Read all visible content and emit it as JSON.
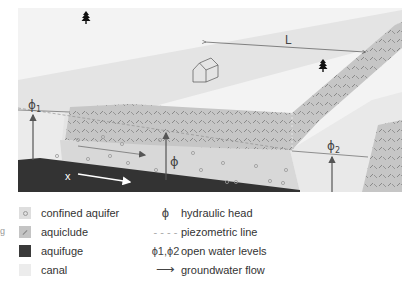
{
  "diagram": {
    "labels": {
      "length": "L",
      "phi1": "ϕ",
      "phi1_sub": "1",
      "phi2": "ϕ",
      "phi2_sub": "2",
      "phi": "ϕ",
      "x": "x"
    },
    "icons": [
      "tree-icon",
      "tree-icon",
      "house-icon"
    ],
    "colors": {
      "sky_ground": "#f2f2f2",
      "canal": "#e6e6e6",
      "aquiclude": "#c6c6c6",
      "aquifer": "#dadada",
      "aquifuge": "#333333",
      "arrow": "#555555"
    }
  },
  "legend": {
    "left": [
      {
        "label": "confined aquifer"
      },
      {
        "label": "aquiclude"
      },
      {
        "label": "aquifuge"
      },
      {
        "label": "canal"
      }
    ],
    "right": [
      {
        "symbol": "ϕ",
        "label": "hydraulic head"
      },
      {
        "symbol": "- - - -",
        "label": "piezometric line"
      },
      {
        "symbol": "ϕ1,ϕ2",
        "label": "open water levels"
      },
      {
        "symbol": "⟶",
        "label": "groundwater flow"
      }
    ]
  },
  "side_mark": "g"
}
